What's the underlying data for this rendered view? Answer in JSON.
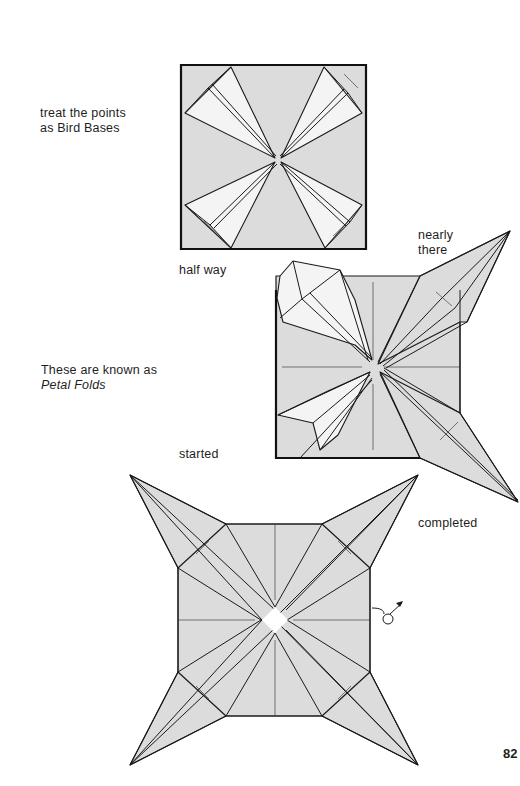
{
  "captions": {
    "bird_bases": [
      "treat the points",
      "as Bird Bases"
    ],
    "half_way": "half way",
    "nearly_there": [
      "nearly",
      "there"
    ],
    "petal_folds_intro": "These are known as",
    "petal_folds_term": "Petal Folds",
    "started": "started",
    "completed": "completed"
  },
  "page_number": "82",
  "colors": {
    "paper_shade": "#dcdcdc",
    "line": "#1a1a1a",
    "background": "#ffffff"
  },
  "diagrams": [
    {
      "id": "step-bird-base-square",
      "description": "square with four corner points folded as bird bases"
    },
    {
      "id": "step-in-progress",
      "description": "square with petal folds started, half way, nearly there"
    },
    {
      "id": "step-completed",
      "description": "four-pointed star with all petal folds completed, turn-over arrow"
    }
  ],
  "icons": {
    "turn_over": "turn-over-arrow-icon"
  }
}
